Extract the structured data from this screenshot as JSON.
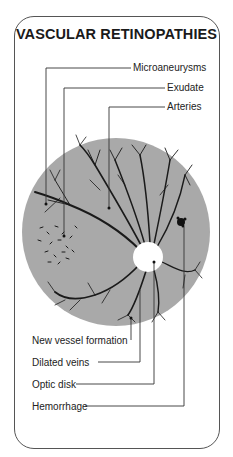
{
  "title": "VASCULAR RETINOPATHIES",
  "labels": {
    "microaneurysms": "Microaneurysms",
    "exudate": "Exudate",
    "arteries": "Arteries",
    "new_vessel_formation": "New vessel formation",
    "dilated_veins": "Dilated veins",
    "optic_disk": "Optic disk",
    "hemorrhage": "Hemorrhage"
  },
  "colors": {
    "fundus": "#a9a9a9",
    "vessels": "#1a1a1a",
    "optic_disk": "#ffffff",
    "lines": "#333333"
  }
}
